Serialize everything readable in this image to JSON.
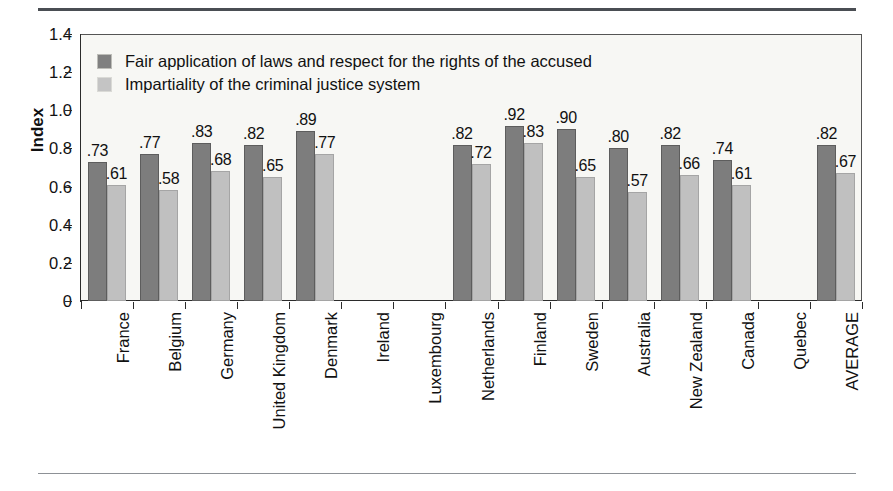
{
  "chart_data": {
    "type": "bar",
    "title": "",
    "subtitle": "",
    "xlabel": "",
    "ylabel": "Index",
    "ylim": [
      0,
      1.4
    ],
    "grid": false,
    "legend_position": "top-left",
    "ytick_labels": [
      "0",
      "0.2",
      "0.4",
      "0.6",
      "0.8",
      "1.0",
      "1.2",
      "1.4"
    ],
    "ytick_values": [
      0,
      0.2,
      0.4,
      0.6,
      0.8,
      1.0,
      1.2,
      1.4
    ],
    "categories": [
      "France",
      "Belgium",
      "Germany",
      "United Kingdom",
      "Denmark",
      "Ireland",
      "Luxembourg",
      "Netherlands",
      "Finland",
      "Sweden",
      "Australia",
      "New Zealand",
      "Canada",
      "Quebec",
      "AVERAGE"
    ],
    "series": [
      {
        "name": "Fair application of laws and respect for the rights of the accused",
        "color": "#7d7d7d",
        "values": [
          0.73,
          0.77,
          0.83,
          0.82,
          0.89,
          null,
          null,
          0.82,
          0.92,
          0.9,
          0.8,
          0.82,
          0.74,
          null,
          0.82
        ],
        "labels": [
          ".73",
          ".77",
          ".83",
          ".82",
          ".89",
          "",
          "",
          ".82",
          ".92",
          ".90",
          ".80",
          ".82",
          ".74",
          "",
          ".82"
        ]
      },
      {
        "name": "Impartiality of the criminal justice system",
        "color": "#c0c0c0",
        "values": [
          0.61,
          0.58,
          0.68,
          0.65,
          0.77,
          null,
          null,
          0.72,
          0.83,
          0.65,
          0.57,
          0.66,
          0.61,
          null,
          0.67
        ],
        "labels": [
          ".61",
          ".58",
          ".68",
          ".65",
          ".77",
          "",
          "",
          ".72",
          ".83",
          ".65",
          ".57",
          ".66",
          ".61",
          "",
          ".67"
        ]
      }
    ]
  },
  "legend": {
    "items": [
      {
        "label": "Fair application of laws and respect for the rights of the accused",
        "swatch": "dark"
      },
      {
        "label": "Impartiality of the criminal justice system",
        "swatch": "light"
      }
    ]
  },
  "colors": {
    "series_dark": "#7d7d7d",
    "series_light": "#c0c0c0",
    "plot_background": "#f7f7f4",
    "axis": "#2b2b2b",
    "rule_top": "#4a4e53",
    "rule_bottom": "#8d9196"
  }
}
